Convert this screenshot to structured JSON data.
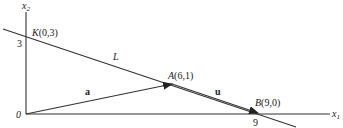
{
  "figure": {
    "axes": {
      "x_label": "x",
      "x_sub": "1",
      "y_label": "x",
      "y_sub": "2",
      "origin_label": "0",
      "x_tick": "9",
      "y_tick": "3"
    },
    "line": {
      "label": "L"
    },
    "points": {
      "K": {
        "name": "K",
        "coords": "(0,3)"
      },
      "A": {
        "name": "A",
        "coords": "(6,1)"
      },
      "B": {
        "name": "B",
        "coords": "(9,0)"
      }
    },
    "vectors": {
      "a": {
        "label": "a"
      },
      "u": {
        "label": "u"
      }
    },
    "colors": {
      "stroke": "#333333",
      "text": "#222222",
      "background": "#ffffff"
    }
  }
}
